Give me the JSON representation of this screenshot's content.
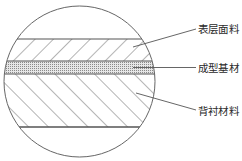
{
  "figure": {
    "type": "layered-material-cross-section",
    "colors": {
      "line": "#555555",
      "hatch": "#6a6a6a",
      "dot_fill": "#d8d8d8",
      "dot": "#8a8a8a",
      "background": "#ffffff"
    },
    "circle": {
      "cx": 79.5,
      "cy": 81.5,
      "r": 75.5
    },
    "layers": [
      {
        "id": "surface",
        "label": "表层面料",
        "y_top": 39,
        "y_bottom": 61,
        "pattern": "hatch-forward"
      },
      {
        "id": "core",
        "label": "成型基材",
        "y_top": 61,
        "y_bottom": 74,
        "pattern": "dots"
      },
      {
        "id": "backing",
        "label": "背衬材料",
        "y_top": 74,
        "y_bottom": 127,
        "pattern": "hatch-backward"
      }
    ],
    "labels": [
      {
        "text": "表层面料",
        "x": 198,
        "y": 23,
        "leader": {
          "x1": 133,
          "y1": 47,
          "x2": 196,
          "y2": 29
        }
      },
      {
        "text": "成型基材",
        "x": 198,
        "y": 62,
        "leader": {
          "x1": 133,
          "y1": 67.5,
          "x2": 196,
          "y2": 67.5
        }
      },
      {
        "text": "背衬材料",
        "x": 198,
        "y": 105,
        "leader": {
          "x1": 136,
          "y1": 93,
          "x2": 196,
          "y2": 110
        }
      }
    ]
  }
}
